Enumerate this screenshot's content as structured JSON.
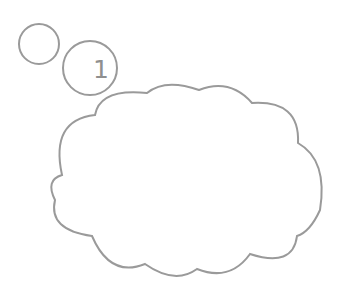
{
  "bubble": {
    "number": "1",
    "stroke_color": "#9a9a9a",
    "fill_color": "#ffffff"
  }
}
